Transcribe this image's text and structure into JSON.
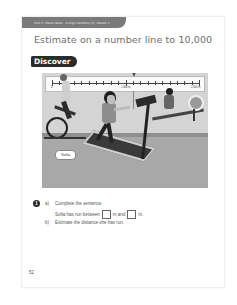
{
  "header": {
    "breadcrumb": "Unit 2: Place value – 4-digit numbers (3), Lesson 1",
    "title": "Estimate on a number line to 10,000"
  },
  "section": {
    "label": "Discover"
  },
  "number_line": {
    "start_label": "0",
    "mid_label": "1,000 m",
    "end_label": "2,000 m",
    "min": 0,
    "max": 2000,
    "tick_interval": 100,
    "arrow_value_estimate": 1050,
    "arrow_icon": "down-arrow-icon"
  },
  "illustration": {
    "name_tag": "Sofia"
  },
  "question": {
    "number": "1",
    "a_label": "a)",
    "a_text": "Complete the sentence:",
    "sentence_part1": "Sofia has run between",
    "sentence_part2": "m and",
    "sentence_part3": "m.",
    "b_label": "b)",
    "b_text": "Estimate the distance she has run."
  },
  "footer": {
    "page_number": "52"
  },
  "colors": {
    "header_band": "#7a7a7a",
    "discover_pill": "#2b2b2b",
    "title_text": "#6e6e6e"
  }
}
